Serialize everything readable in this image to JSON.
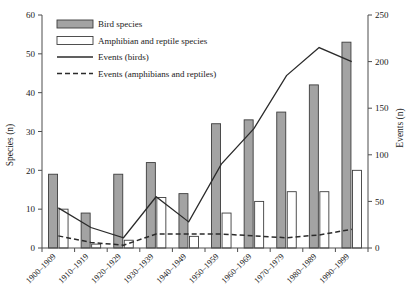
{
  "chart_data": {
    "type": "bar",
    "title": "",
    "subtitle": "",
    "xlabel": "",
    "ylabel": "Species (n)",
    "y2label": "Events (n)",
    "ylim": [
      0,
      60
    ],
    "y2lim": [
      0,
      250
    ],
    "yticks": [
      0,
      10,
      20,
      30,
      40,
      50,
      60
    ],
    "y2ticks": [
      0,
      50,
      100,
      150,
      200,
      250
    ],
    "grid": false,
    "legend_position": "top-left",
    "categories": [
      "1900–1909",
      "1910–1919",
      "1920–1929",
      "1930–1939",
      "1940–1949",
      "1950–1959",
      "1960–1969",
      "1970–1979",
      "1980–1989",
      "1990–1999"
    ],
    "series": [
      {
        "name": "Bird species",
        "kind": "bar",
        "axis": "left",
        "fill": "#a3a3a3",
        "stroke": "#3d3d3d",
        "values": [
          19,
          9,
          19,
          22,
          14,
          32,
          33,
          35,
          42,
          53
        ]
      },
      {
        "name": "Amphibian and reptile species",
        "kind": "bar",
        "axis": "left",
        "fill": "#ffffff",
        "stroke": "#3d3d3d",
        "values": [
          10,
          1,
          2,
          13,
          3,
          9,
          12,
          14.5,
          14.5,
          20
        ]
      },
      {
        "name": "Events (birds)",
        "kind": "line",
        "axis": "right",
        "stroke": "#2b2b2b",
        "dash": "none",
        "values": [
          43,
          22,
          11,
          55,
          28,
          90,
          128,
          185,
          215,
          200
        ]
      },
      {
        "name": "Events (amphibians and reptiles)",
        "kind": "line",
        "axis": "right",
        "stroke": "#2b2b2b",
        "dash": "dashed",
        "values": [
          13,
          6,
          3,
          15,
          15,
          15,
          13,
          11,
          14,
          20
        ]
      }
    ]
  },
  "legend": {
    "items": [
      {
        "label": "Bird species",
        "swatch": "filled-bar-swatch"
      },
      {
        "label": "Amphibian and reptile species",
        "swatch": "open-bar-swatch"
      },
      {
        "label": "Events (birds)",
        "swatch": "solid-line-swatch"
      },
      {
        "label": "Events (amphibians and reptiles)",
        "swatch": "dashed-line-swatch"
      }
    ]
  },
  "colors": {
    "bar_fill": "#a3a3a3",
    "bar_stroke": "#3d3d3d",
    "line": "#2b2b2b",
    "axis": "#4d4d4d",
    "background": "#ffffff"
  }
}
